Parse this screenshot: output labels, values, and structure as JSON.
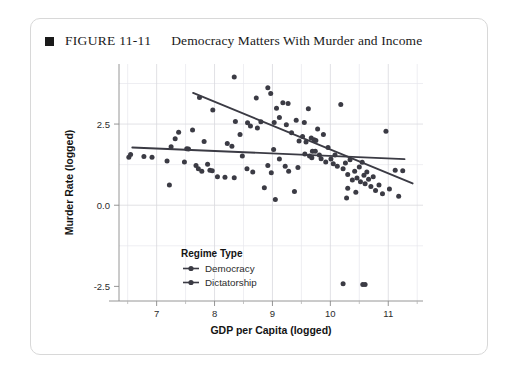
{
  "figure": {
    "bullet_icon": "black-square-bullet",
    "number": "FIGURE 11-11",
    "title": "Democracy Matters With Murder and Income"
  },
  "colors": {
    "point": "#3b3b44",
    "trendline": "#3b3b44",
    "grid": "#d9d9de",
    "axis": "#8a8a8a",
    "card_border": "#d8d8d8",
    "text": "#1a1a1a"
  },
  "chart_data": {
    "type": "scatter",
    "title": "Democracy Matters With Murder and Income",
    "xlabel": "GDP per Capita (logged)",
    "ylabel": "Murder Rate (logged)",
    "xlim": [
      6.35,
      11.6
    ],
    "ylim": [
      -2.95,
      4.35
    ],
    "xticks": [
      7,
      8,
      9,
      10,
      11
    ],
    "xtick_labels": [
      "7",
      "8",
      "9",
      "10",
      "11"
    ],
    "xticks_minor": [
      6.5,
      7.5,
      8.5,
      9.5,
      10.5,
      11.5
    ],
    "yticks": [
      -2.5,
      0.0,
      2.5
    ],
    "ytick_labels": [
      "-2.5",
      "0.0",
      "2.5"
    ],
    "yticks_minor": [
      -1.25,
      1.25,
      3.75
    ],
    "grid": true,
    "legend": {
      "title": "Regime Type",
      "position": "inside-bottom-left",
      "entries": [
        {
          "name": "Democracy",
          "marker": "line-dot",
          "color": "#3b3b44"
        },
        {
          "name": "Dictatorship",
          "marker": "line-dot",
          "color": "#3b3b44"
        }
      ]
    },
    "series": [
      {
        "name": "Democracy",
        "trendline": {
          "x": [
            7.63,
            11.42
          ],
          "y": [
            3.46,
            0.67
          ],
          "slope": -0.736,
          "intercept": 9.08
        },
        "points": [
          [
            7.74,
            3.32
          ],
          [
            7.97,
            2.93
          ],
          [
            8.34,
            3.95
          ],
          [
            8.36,
            2.58
          ],
          [
            8.57,
            2.54
          ],
          [
            8.62,
            2.44
          ],
          [
            8.72,
            3.3
          ],
          [
            8.8,
            2.57
          ],
          [
            8.92,
            3.62
          ],
          [
            8.97,
            3.44
          ],
          [
            9.03,
            2.55
          ],
          [
            9.07,
            2.99
          ],
          [
            9.12,
            2.7
          ],
          [
            9.18,
            3.16
          ],
          [
            9.24,
            2.48
          ],
          [
            9.27,
            3.13
          ],
          [
            9.33,
            2.23
          ],
          [
            9.41,
            2.62
          ],
          [
            9.46,
            1.98
          ],
          [
            9.52,
            2.12
          ],
          [
            9.55,
            2.55
          ],
          [
            9.58,
            1.95
          ],
          [
            9.62,
            2.97
          ],
          [
            9.67,
            2.07
          ],
          [
            9.69,
            1.66
          ],
          [
            9.72,
            2.02
          ],
          [
            9.75,
            1.99
          ],
          [
            9.78,
            2.35
          ],
          [
            9.81,
            1.55
          ],
          [
            9.84,
            1.43
          ],
          [
            9.88,
            2.18
          ],
          [
            9.92,
            1.33
          ],
          [
            9.96,
            1.78
          ],
          [
            10.01,
            1.42
          ],
          [
            10.05,
            1.28
          ],
          [
            10.08,
            1.55
          ],
          [
            10.12,
            1.2
          ],
          [
            10.18,
            3.1
          ],
          [
            10.22,
            1.12
          ],
          [
            10.26,
            1.3
          ],
          [
            10.3,
            0.95
          ],
          [
            10.34,
            1.4
          ],
          [
            10.38,
            0.78
          ],
          [
            10.42,
            1.05
          ],
          [
            10.46,
            0.84
          ],
          [
            10.5,
            1.18
          ],
          [
            10.52,
            0.72
          ],
          [
            10.55,
            1.32
          ],
          [
            10.58,
            0.92
          ],
          [
            10.6,
            0.66
          ],
          [
            10.63,
            1.02
          ],
          [
            10.66,
            0.8
          ],
          [
            10.7,
            0.58
          ],
          [
            10.74,
            0.88
          ],
          [
            10.78,
            0.45
          ],
          [
            10.84,
            0.62
          ],
          [
            10.9,
            0.35
          ],
          [
            10.96,
            2.28
          ],
          [
            11.02,
            0.5
          ],
          [
            11.12,
            1.08
          ],
          [
            11.25,
            1.06
          ],
          [
            11.18,
            0.28
          ],
          [
            10.3,
            0.52
          ],
          [
            10.44,
            0.4
          ]
        ]
      },
      {
        "name": "Dictatorship",
        "trendline": {
          "x": [
            6.58,
            11.28
          ],
          "y": [
            1.78,
            1.42
          ],
          "slope": -0.077,
          "intercept": 2.29
        },
        "points": [
          [
            6.52,
            1.48
          ],
          [
            6.55,
            1.56
          ],
          [
            6.78,
            1.5
          ],
          [
            6.92,
            1.48
          ],
          [
            7.18,
            1.36
          ],
          [
            7.22,
            0.62
          ],
          [
            7.25,
            1.8
          ],
          [
            7.32,
            2.05
          ],
          [
            7.38,
            2.25
          ],
          [
            7.48,
            1.33
          ],
          [
            7.52,
            1.74
          ],
          [
            7.55,
            1.73
          ],
          [
            7.62,
            2.32
          ],
          [
            7.68,
            1.22
          ],
          [
            7.72,
            1.12
          ],
          [
            7.78,
            1.05
          ],
          [
            7.82,
            1.96
          ],
          [
            7.88,
            1.26
          ],
          [
            7.92,
            1.08
          ],
          [
            7.96,
            1.06
          ],
          [
            8.05,
            0.88
          ],
          [
            8.18,
            0.86
          ],
          [
            8.22,
            1.9
          ],
          [
            8.34,
            0.85
          ],
          [
            8.44,
            2.18
          ],
          [
            8.48,
            1.52
          ],
          [
            8.56,
            1.12
          ],
          [
            8.66,
            1.02
          ],
          [
            8.74,
            2.38
          ],
          [
            8.86,
            0.54
          ],
          [
            8.92,
            1.22
          ],
          [
            8.98,
            1.0
          ],
          [
            9.02,
            1.72
          ],
          [
            9.05,
            0.18
          ],
          [
            9.12,
            1.42
          ],
          [
            9.22,
            1.2
          ],
          [
            9.28,
            1.05
          ],
          [
            9.38,
            0.42
          ],
          [
            9.44,
            1.16
          ],
          [
            9.56,
            1.58
          ],
          [
            9.64,
            1.52
          ],
          [
            9.68,
            1.46
          ],
          [
            9.74,
            1.66
          ],
          [
            10.22,
            -2.42
          ],
          [
            10.56,
            -2.44
          ],
          [
            10.6,
            -2.44
          ],
          [
            10.28,
            0.22
          ],
          [
            8.3,
            1.82
          ]
        ]
      }
    ]
  }
}
